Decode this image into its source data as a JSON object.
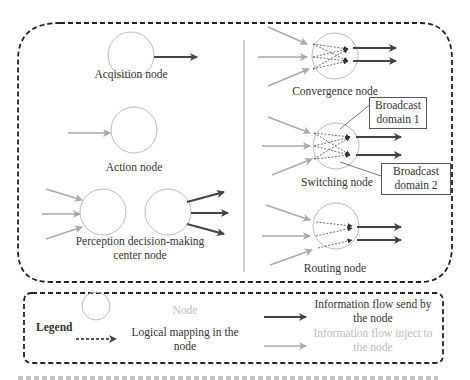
{
  "diagram": {
    "left_nodes": {
      "acquisition": "Acqisition node",
      "action": "Action node",
      "perception_line1": "Perception decision-making",
      "perception_line2": "center node"
    },
    "right_nodes": {
      "convergence": "Convergence node",
      "switching": "Switching node",
      "routing": "Routing node"
    },
    "callouts": {
      "broadcast1_line1": "Broadcast",
      "broadcast1_line2": "domain 1",
      "broadcast2_line1": "Broadcast",
      "broadcast2_line2": "domain 2"
    }
  },
  "legend": {
    "title": "Legend",
    "node": "Node",
    "logical_line1": "Logical mapping in the",
    "logical_line2": "node",
    "send_line1": "Information flow send by",
    "send_line2": "the node",
    "inject_line1": "Information flow inject to",
    "inject_line2": "the node"
  },
  "colors": {
    "send_arrow": "#444444",
    "inject_arrow": "#aaaaaa",
    "node_circle": "#bbbbbb",
    "dashed_border": "#222222"
  }
}
